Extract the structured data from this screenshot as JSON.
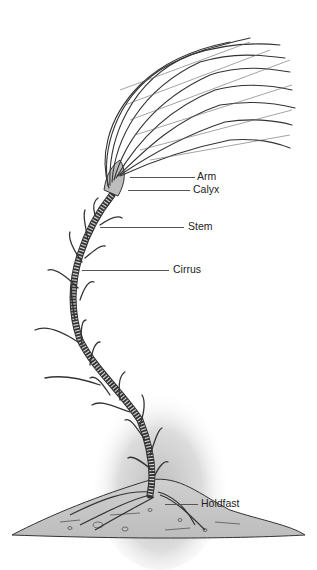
{
  "figure": {
    "labels": [
      {
        "id": "arm",
        "text": "Arm"
      },
      {
        "id": "calyx",
        "text": "Calyx"
      },
      {
        "id": "stem",
        "text": "Stem"
      },
      {
        "id": "cirrus",
        "text": "Cirrus"
      },
      {
        "id": "holdfast",
        "text": "Holdfast"
      }
    ]
  }
}
